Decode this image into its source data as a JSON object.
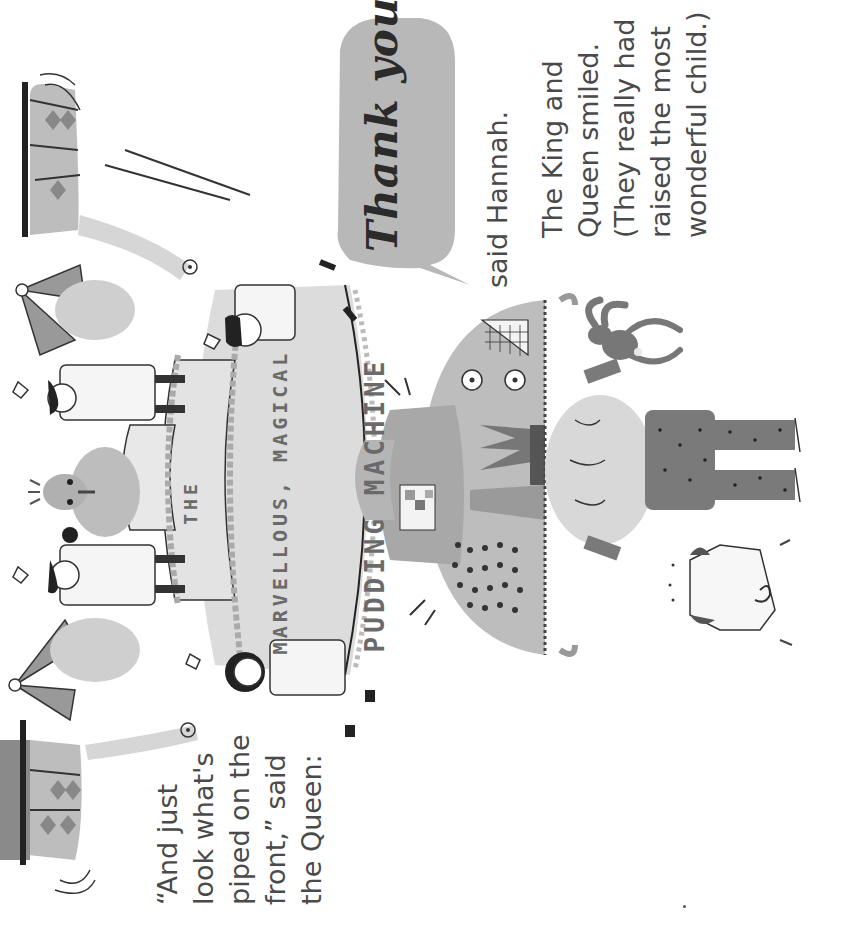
{
  "page": {
    "orientation": "rotated-90-ccw",
    "background": "#ffffff"
  },
  "text_blocks": {
    "queen_quote": "“And just\nlook what's\npiped on the\nfront,” said\nthe Queen:",
    "speech_bubble": "Thank you!",
    "hannah_said": "said Hannah.",
    "king_queen": "The King and\nQueen smiled.\n(They really had\nraised the most\nwonderful child.)"
  },
  "cake_lettering": {
    "line1": "THE",
    "line2": "MARVELLOUS, MAGICAL",
    "line3": "PUDDING MACHINE"
  },
  "illustration": {
    "elements": [
      "pudding-machine-cake",
      "chef-with-spoon",
      "chef-with-trowel",
      "chef-with-moustache",
      "chef-curly-hair",
      "bird-on-cake",
      "robot-machine",
      "child-hugging-robot",
      "toy-rabbit",
      "dog",
      "left-arm-with-sleeve",
      "right-arm-with-sleeve",
      "bow-ornaments"
    ],
    "colors": {
      "ink": "#2b2b2b",
      "light_gray": "#d4d4d4",
      "mid_gray": "#a9a9a9",
      "dark_gray": "#6e6e6e",
      "bubble": "#b8b8b8"
    }
  }
}
